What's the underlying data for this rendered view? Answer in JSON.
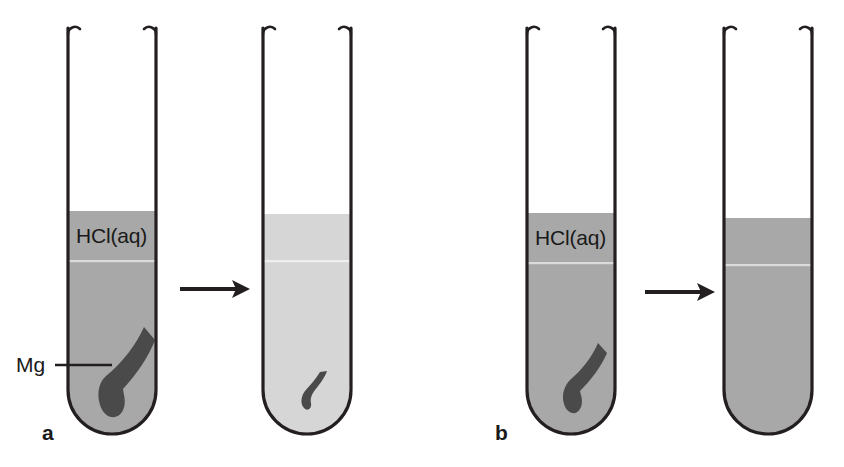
{
  "figure": {
    "width": 844,
    "height": 467,
    "background": "#ffffff"
  },
  "colors": {
    "glass_outline": "#231f20",
    "liquid_dark": "#a8a8a8",
    "liquid_light": "#d6d6d6",
    "metal_ribbon": "#4a4a4a",
    "text": "#1a1a1a",
    "arrow": "#231f20",
    "meniscus_line": "#e8e8e8"
  },
  "panels": [
    {
      "id": "panel-a",
      "label": "a",
      "label_x": 42,
      "label_y": 440,
      "arrow": {
        "x1": 180,
        "x2": 248,
        "y": 289
      },
      "tubes": [
        {
          "id": "tube-a1",
          "role": "before",
          "x": 68,
          "width": 88,
          "top": 28,
          "bottom": 433,
          "liquid_top": 211,
          "liquid_color": "#a8a8a8",
          "liquid_label": "HCl(aq)",
          "liquid_label_x": 76,
          "liquid_label_y": 243,
          "meniscus_y": 262,
          "ribbon": {
            "present": true,
            "size": "large",
            "cx": 125,
            "cy": 372
          },
          "pointer_label": {
            "text": "Mg",
            "x": 16,
            "y": 372,
            "leader_x1": 55,
            "leader_x2": 112,
            "leader_y": 365
          }
        },
        {
          "id": "tube-a2",
          "role": "after",
          "x": 263,
          "width": 88,
          "top": 28,
          "bottom": 433,
          "liquid_top": 214,
          "liquid_color": "#d6d6d6",
          "liquid_label": "",
          "meniscus_y": 262,
          "ribbon": {
            "present": true,
            "size": "small",
            "cx": 311,
            "cy": 387
          },
          "pointer_label": null
        }
      ]
    },
    {
      "id": "panel-b",
      "label": "b",
      "label_x": 495,
      "label_y": 440,
      "arrow": {
        "x1": 645,
        "x2": 713,
        "y": 292
      },
      "tubes": [
        {
          "id": "tube-b1",
          "role": "before",
          "x": 527,
          "width": 88,
          "top": 28,
          "bottom": 433,
          "liquid_top": 213,
          "liquid_color": "#a8a8a8",
          "liquid_label": "HCl(aq)",
          "liquid_label_x": 535,
          "liquid_label_y": 245,
          "meniscus_y": 264,
          "ribbon": {
            "present": true,
            "size": "medium",
            "cx": 578,
            "cy": 381
          },
          "pointer_label": null
        },
        {
          "id": "tube-b2",
          "role": "after",
          "x": 724,
          "width": 88,
          "top": 28,
          "bottom": 433,
          "liquid_top": 218,
          "liquid_color": "#a8a8a8",
          "liquid_label": "",
          "meniscus_y": 266,
          "ribbon": {
            "present": false
          },
          "pointer_label": null
        }
      ]
    }
  ]
}
